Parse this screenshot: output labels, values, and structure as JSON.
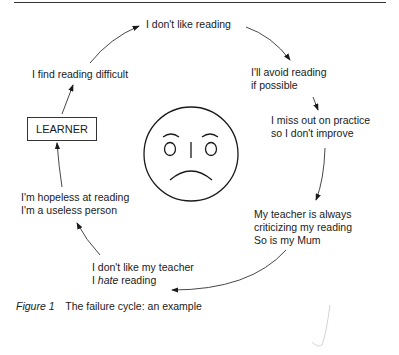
{
  "diagram": {
    "title": "The failure cycle",
    "center_box": "LEARNER",
    "center_icon": "sad-face-icon",
    "nodes": [
      {
        "id": "dont-like",
        "lines": [
          "I don't like reading"
        ]
      },
      {
        "id": "avoid",
        "lines": [
          "I'll avoid reading",
          "if possible"
        ]
      },
      {
        "id": "miss-out",
        "lines": [
          "I miss out on practice",
          "so I don't improve"
        ]
      },
      {
        "id": "criticizing",
        "lines": [
          "My teacher is always",
          "criticizing my reading",
          "So is my Mum"
        ]
      },
      {
        "id": "hate",
        "lines": [
          "I don't like my teacher"
        ],
        "line2_prefix": "I ",
        "line2_emph": "hate",
        "line2_suffix": " reading"
      },
      {
        "id": "hopeless",
        "lines": [
          "I'm hopeless at reading",
          "I'm a useless person"
        ]
      },
      {
        "id": "difficult",
        "lines": [
          "I find reading difficult"
        ]
      }
    ],
    "flow": [
      "LEARNER",
      "I find reading difficult",
      "I don't like reading",
      "I'll avoid reading if possible",
      "I miss out on practice so I don't improve",
      "My teacher is always criticizing my reading So is my Mum",
      "I don't like my teacher I hate reading",
      "I'm hopeless at reading I'm a useless person",
      "LEARNER"
    ]
  },
  "caption": {
    "figure_label": "Figure 1",
    "text": "The failure cycle: an example"
  }
}
